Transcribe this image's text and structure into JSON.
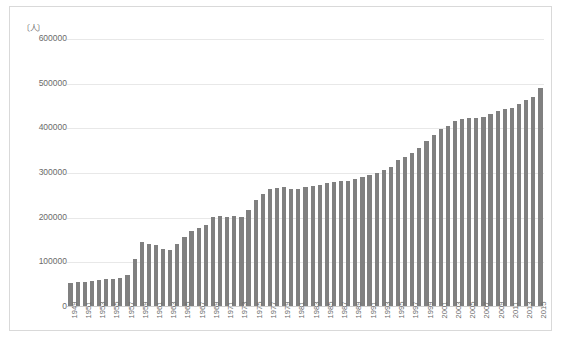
{
  "figure": {
    "unit_label": "〔人〕",
    "caption": ""
  },
  "chart_data": {
    "type": "bar",
    "title": "",
    "xlabel": "",
    "ylabel": "〔人〕",
    "ylim": [
      0,
      600000
    ],
    "ytick_values": [
      0,
      100000,
      200000,
      300000,
      400000,
      500000,
      600000
    ],
    "ytick_labels": [
      "0",
      "100000",
      "200000",
      "300000",
      "400000",
      "500000",
      "600000"
    ],
    "grid": true,
    "legend": "none",
    "bar_color": "#808080",
    "categories": [
      "1949",
      "1950",
      "1951",
      "1952",
      "1953",
      "1954",
      "1955",
      "1956",
      "1957",
      "1958",
      "1959",
      "1960",
      "1961",
      "1962",
      "1963",
      "1964",
      "1965",
      "1966",
      "1967",
      "1968",
      "1969",
      "1970",
      "1971",
      "1972",
      "1973",
      "1974",
      "1975",
      "1976",
      "1977",
      "1978",
      "1979",
      "1980",
      "1981",
      "1982",
      "1983",
      "1984",
      "1985",
      "1986",
      "1987",
      "1988",
      "1989",
      "1990",
      "1991",
      "1992",
      "1993",
      "1994",
      "1995",
      "1996",
      "1997",
      "1998",
      "1999",
      "2000",
      "2001",
      "2002",
      "2003",
      "2004",
      "2005",
      "2006",
      "2007",
      "2008",
      "2009",
      "2010",
      "2011",
      "2012",
      "2013",
      "2014",
      "2015"
    ],
    "tick_labels_shown": [
      "1949",
      "1951",
      "1953",
      "1955",
      "1957",
      "1959",
      "1961",
      "1963",
      "1965",
      "1967",
      "1969",
      "1971",
      "1973",
      "1975",
      "1977",
      "1979",
      "1981",
      "1983",
      "1985",
      "1987",
      "1989",
      "1991",
      "1993",
      "1995",
      "1997",
      "1999",
      "2001",
      "2003",
      "2005",
      "2007",
      "2009",
      "2011",
      "2013",
      "2015"
    ],
    "values": [
      52000,
      54000,
      55000,
      57000,
      58000,
      61000,
      60000,
      63000,
      70000,
      105000,
      143000,
      140000,
      136000,
      128000,
      125000,
      140000,
      155000,
      168000,
      176000,
      182000,
      200000,
      203000,
      201000,
      202000,
      200000,
      215000,
      238000,
      252000,
      263000,
      266000,
      267000,
      264000,
      264000,
      268000,
      270000,
      272000,
      276000,
      278000,
      280000,
      282000,
      285000,
      290000,
      294000,
      300000,
      305000,
      312000,
      328000,
      335000,
      344000,
      356000,
      370000,
      385000,
      398000,
      405000,
      415000,
      420000,
      422000,
      422000,
      425000,
      432000,
      438000,
      443000,
      446000,
      455000,
      462000,
      470000,
      489000
    ]
  }
}
